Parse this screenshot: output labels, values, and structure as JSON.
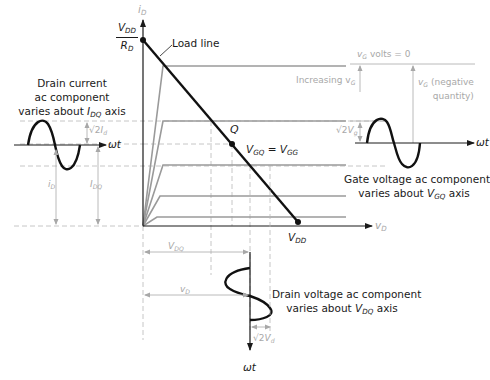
{
  "colors": {
    "foreground": "#1a1a1a",
    "secondary": "#a8a8a8",
    "curves": "#9a9a9a",
    "background": "#ffffff"
  },
  "axes": {
    "y_axis_label": "i",
    "y_axis_sub": "D",
    "x_axis_label": "v",
    "x_axis_sub": "D",
    "origin": [
      143,
      226
    ]
  },
  "load_line": {
    "label": "Load line",
    "top_intercept_num": "V",
    "top_intercept_num_sub": "DD",
    "top_intercept_den": "R",
    "top_intercept_den_sub": "D",
    "bottom_intercept": "V",
    "bottom_intercept_sub": "DD"
  },
  "q_point": {
    "label": "Q",
    "eq_left": "V",
    "eq_left_sub": "GQ",
    "eq_sign": "=",
    "eq_right": "V",
    "eq_right_sub": "GG"
  },
  "gate_labels": {
    "vg_zero_prefix": "v",
    "vg_zero_sub": "G",
    "vg_zero_suffix": "volts = 0",
    "increasing": "Increasing v",
    "increasing_sub": "G",
    "negative_prefix": "v",
    "negative_sub": "G",
    "negative_line1": "(negative",
    "negative_line2": "quantity)"
  },
  "drain_current": {
    "caption_line1": "Drain current",
    "caption_line2": "ac component",
    "caption_line3_pre": "varies about ",
    "caption_line3_var": "I",
    "caption_line3_sub": "DQ",
    "caption_line3_post": " axis",
    "amplitude_label": "√2",
    "amplitude_var": "I",
    "amplitude_sub": "d",
    "id_label": "i",
    "id_sub": "D",
    "idq_label": "I",
    "idq_sub": "DQ",
    "axis_label": "ωt"
  },
  "gate_voltage": {
    "caption_line1": "Gate voltage ac component",
    "caption_line2_pre": "varies about ",
    "caption_line2_var": "V",
    "caption_line2_sub": "GQ",
    "caption_line2_post": " axis",
    "amplitude_label": "√2",
    "amplitude_var": "V",
    "amplitude_sub": "g",
    "axis_label": "ωt"
  },
  "drain_voltage": {
    "caption_line1": "Drain voltage ac component",
    "caption_line2_pre": "varies about ",
    "caption_line2_var": "V",
    "caption_line2_sub": "DQ",
    "caption_line2_post": " axis",
    "amplitude_label": "√2",
    "amplitude_var": "V",
    "amplitude_sub": "d",
    "vdq_label": "V",
    "vdq_sub": "DQ",
    "vd_label": "v",
    "vd_sub": "D",
    "axis_label": "ωt"
  }
}
